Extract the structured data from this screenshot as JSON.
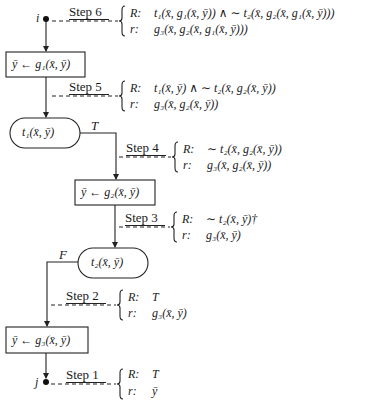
{
  "diagram": {
    "type": "flowchart",
    "nodes": {
      "start": {
        "label": "i"
      },
      "end": {
        "label": "j"
      },
      "assign1": {
        "text": "ȳ ← g₁(x̄, ȳ)"
      },
      "test1": {
        "text": "t₁(x̄, ȳ)",
        "branch_label": "T"
      },
      "assign2": {
        "text": "ȳ ← g₂(x̄, ȳ)"
      },
      "test2": {
        "text": "t₂(x̄, ȳ)",
        "branch_label": "F"
      },
      "assign3": {
        "text": "ȳ ← g₃(x̄, ȳ)"
      }
    },
    "steps": [
      {
        "label": "Step 6",
        "R_key": "R:",
        "R": "t₁(x̄, g₁(x̄, ȳ)) ∧ ∼ t₂(x̄, g₂(x̄, g₁(x̄, ȳ)))",
        "r_key": "r:",
        "r": "g₃(x̄, g₂(x̄, g₁(x̄, ȳ)))"
      },
      {
        "label": "Step 5",
        "R_key": "R:",
        "R": "t₁(x̄, ȳ) ∧ ∼ t₂(x̄, g₂(x̄, ȳ))",
        "r_key": "r:",
        "r": "g₃(x̄, g₂(x̄, ȳ))"
      },
      {
        "label": "Step 4",
        "R_key": "R:",
        "R": "∼ t₂(x̄, g₂(x̄, ȳ))",
        "r_key": "r:",
        "r": "g₃(x̄, g₂(x̄, ȳ))"
      },
      {
        "label": "Step 3",
        "R_key": "R:",
        "R": "∼ t₂(x̄, ȳ)†",
        "r_key": "r:",
        "r": "g₃(x̄, ȳ)"
      },
      {
        "label": "Step 2",
        "R_key": "R:",
        "R": "T",
        "r_key": "r:",
        "r": "g₃(x̄, ȳ)"
      },
      {
        "label": "Step 1",
        "R_key": "R:",
        "R": "T",
        "r_key": "r:",
        "r": "ȳ"
      }
    ]
  }
}
